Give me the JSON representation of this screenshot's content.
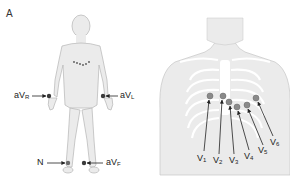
{
  "figure": {
    "panel_label": "A",
    "limb_panel": {
      "title": "Limb lead electrode placement",
      "leads": [
        {
          "id": "aVR",
          "main": "aV",
          "sub": "R",
          "position": "right wrist"
        },
        {
          "id": "aVL",
          "main": "aV",
          "sub": "L",
          "position": "left wrist"
        },
        {
          "id": "N",
          "main": "N",
          "sub": "",
          "position": "right ankle"
        },
        {
          "id": "aVF",
          "main": "aV",
          "sub": "F",
          "position": "left ankle"
        }
      ]
    },
    "chest_panel": {
      "title": "Precordial lead electrode placement",
      "leads": [
        {
          "id": "V1",
          "main": "V",
          "sub": "1"
        },
        {
          "id": "V2",
          "main": "V",
          "sub": "2"
        },
        {
          "id": "V3",
          "main": "V",
          "sub": "3"
        },
        {
          "id": "V4",
          "main": "V",
          "sub": "4"
        },
        {
          "id": "V5",
          "main": "V",
          "sub": "5"
        },
        {
          "id": "V6",
          "main": "V",
          "sub": "6"
        }
      ]
    },
    "colors": {
      "body_fill": "#ebebeb",
      "body_stroke": "#b5b5b5",
      "rib_color": "#ffffff",
      "limb_electrode": "#3a3a3a",
      "chest_electrode": "#8a8a8a",
      "arrow": "#222222"
    }
  }
}
